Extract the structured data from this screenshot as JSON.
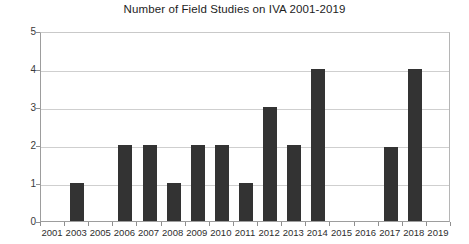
{
  "chart_data": {
    "type": "bar",
    "title": "Number of Field Studies on IVA 2001-2019",
    "xlabel": "",
    "ylabel": "",
    "categories": [
      "2001",
      "2003",
      "2005",
      "2006",
      "2007",
      "2008",
      "2009",
      "2010",
      "2011",
      "2012",
      "2013",
      "2014",
      "2015",
      "2016",
      "2017",
      "2018",
      "2019"
    ],
    "values": [
      0,
      1,
      0,
      2,
      2,
      1,
      2,
      2,
      1,
      3,
      2,
      4,
      0,
      0,
      1.95,
      4,
      0
    ],
    "ylim": [
      0,
      5
    ],
    "yticks": [
      0,
      1,
      2,
      3,
      4,
      5
    ],
    "ytick_labels": [
      "0",
      "1",
      "2",
      "3",
      "4",
      "5"
    ],
    "grid": true,
    "legend": false,
    "bar_color": "#333333",
    "grid_color": "#cfcfcf",
    "axis_color": "#9d9d9d",
    "background": "#ffffff"
  }
}
